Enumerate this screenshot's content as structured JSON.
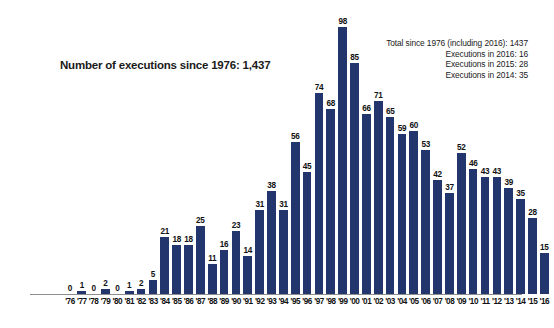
{
  "chart_data": {
    "type": "bar",
    "title": "Number of executions since 1976: 1,437",
    "xlabel": "",
    "ylabel": "",
    "ylim": [
      0,
      100
    ],
    "grid": false,
    "legend": "none",
    "bar_color": "#22356c",
    "categories": [
      "'76",
      "'77",
      "'78",
      "'79",
      "'80",
      "'81",
      "'82",
      "'83",
      "'84",
      "'85",
      "'86",
      "'87",
      "'88",
      "'89",
      "'90",
      "'91",
      "'92",
      "'93",
      "'94",
      "'95",
      "'96",
      "'97",
      "'98",
      "'99",
      "'00",
      "'01",
      "'02",
      "'03",
      "'04",
      "'05",
      "'06",
      "'07",
      "'08",
      "'09",
      "'10",
      "'11",
      "'12",
      "'13",
      "'14",
      "'15",
      "'16"
    ],
    "values": [
      0,
      1,
      0,
      2,
      0,
      1,
      2,
      5,
      21,
      18,
      18,
      25,
      11,
      16,
      23,
      14,
      31,
      38,
      31,
      56,
      45,
      74,
      68,
      98,
      85,
      66,
      71,
      65,
      59,
      60,
      53,
      42,
      37,
      52,
      46,
      43,
      43,
      39,
      35,
      28,
      15
    ],
    "annotations": [
      "Total since 1976 (including 2016): 1437",
      "Executions in 2016: 16",
      "Executions in 2015: 28",
      "Executions in 2014: 35"
    ]
  }
}
